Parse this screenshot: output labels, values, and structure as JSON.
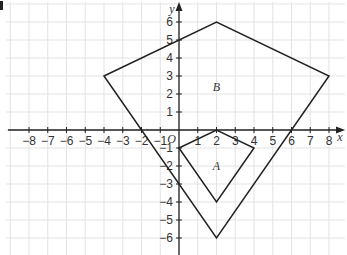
{
  "diagram": {
    "type": "coordinate-grid",
    "axes": {
      "x_label": "x",
      "y_label": "y",
      "origin_label": "O",
      "x_range": [
        -8,
        8
      ],
      "y_range": [
        -6,
        6
      ],
      "x_ticks": [
        -8,
        -7,
        -6,
        -5,
        -4,
        -3,
        -2,
        -1,
        1,
        2,
        3,
        4,
        5,
        6,
        7,
        8
      ],
      "y_ticks": [
        -6,
        -5,
        -4,
        -3,
        -2,
        -1,
        1,
        2,
        3,
        4,
        5,
        6
      ],
      "x_tick_labels": [
        "−8",
        "−7",
        "−6",
        "−5",
        "−4",
        "−3",
        "−2",
        "−1",
        "1",
        "2",
        "3",
        "4",
        "5",
        "6",
        "7",
        "8"
      ],
      "y_tick_labels": [
        "−6",
        "−5",
        "−4",
        "−3",
        "−2",
        "−1",
        "1",
        "2",
        "3",
        "4",
        "5",
        "6"
      ]
    },
    "shapes": [
      {
        "name": "B",
        "label": "B",
        "vertices": [
          [
            -4,
            3
          ],
          [
            2,
            6
          ],
          [
            8,
            3
          ],
          [
            2,
            -6
          ]
        ],
        "label_pos": [
          2,
          2.4
        ]
      },
      {
        "name": "A",
        "label": "A",
        "vertices": [
          [
            0,
            -1
          ],
          [
            2,
            0
          ],
          [
            4,
            -1
          ],
          [
            2,
            -4
          ]
        ],
        "label_pos": [
          2,
          -2
        ]
      }
    ],
    "colors": {
      "grid": "#e3e3e3",
      "axis": "#222222",
      "shape": "#222222",
      "text": "#333333"
    }
  }
}
